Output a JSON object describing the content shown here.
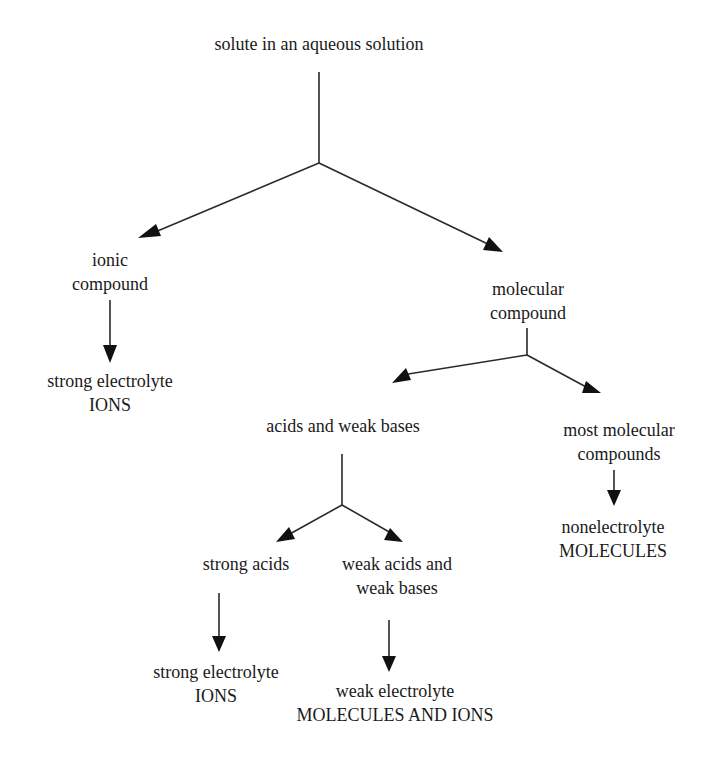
{
  "diagram": {
    "root": {
      "line1": "solute in an aqueous solution"
    },
    "ionic": {
      "line1": "ionic",
      "line2": "compound"
    },
    "ionic_result": {
      "line1": "strong electrolyte",
      "line2": "IONS"
    },
    "molecular": {
      "line1": "molecular",
      "line2": "compound"
    },
    "acids_bases": {
      "line1": "acids and weak bases"
    },
    "most_molecular": {
      "line1": "most molecular",
      "line2": "compounds"
    },
    "nonelectrolyte_result": {
      "line1": "nonelectrolyte",
      "line2": "MOLECULES"
    },
    "strong_acids": {
      "line1": "strong acids"
    },
    "weak_acids_bases": {
      "line1": "weak acids and",
      "line2": "weak bases"
    },
    "strong_acids_result": {
      "line1": "strong electrolyte",
      "line2": "IONS"
    },
    "weak_result": {
      "line1": "weak electrolyte",
      "line2": "MOLECULES AND IONS"
    }
  },
  "colors": {
    "line": "#2a2a2a",
    "text": "#1a1a1a",
    "background": "#ffffff"
  }
}
